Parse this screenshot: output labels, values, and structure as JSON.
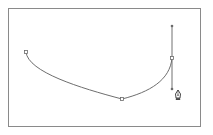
{
  "canvas": {
    "frame": {
      "x": 8,
      "y": 8,
      "width": 193,
      "height": 119
    },
    "border_color": "#8a8a8a",
    "background": "#ffffff"
  },
  "path": {
    "stroke_color": "#6e6e6e",
    "anchors": [
      {
        "name": "start",
        "x": 26,
        "y": 52
      },
      {
        "name": "bottom",
        "x": 122,
        "y": 99
      },
      {
        "name": "end",
        "x": 172,
        "y": 58
      }
    ],
    "handles": {
      "anchor": {
        "x": 172,
        "y": 58
      },
      "in": {
        "x": 172,
        "y": 89
      },
      "out": {
        "x": 172,
        "y": 26
      }
    }
  },
  "tool": {
    "active": "pen-tool",
    "cursor_position": {
      "x": 178,
      "y": 94
    }
  }
}
